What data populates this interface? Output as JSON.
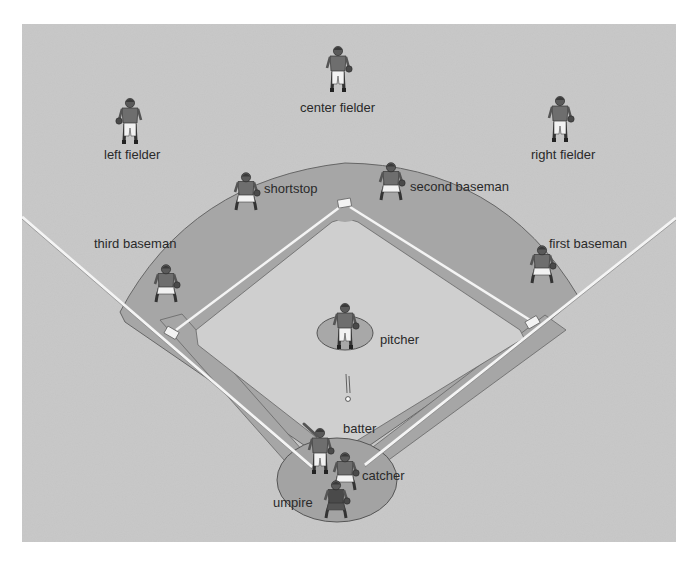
{
  "figure": {
    "colors": {
      "grass": "#c9c9c9",
      "dirt": "#a3a3a3",
      "infield_grass": "#cdcdcd",
      "line": "#f4f4f4",
      "outline": "#555555",
      "jersey": "#6e6e6e",
      "pants": "#f2f2f2",
      "text": "#2a2a2a"
    },
    "positions": [
      {
        "id": "left-fielder",
        "label": "left fielder",
        "label_x": 104,
        "label_y": 148,
        "player_x": 130,
        "player_y": 118,
        "pose": "stand-glove-left"
      },
      {
        "id": "center-fielder",
        "label": "center fielder",
        "label_x": 300,
        "label_y": 101,
        "player_x": 338,
        "player_y": 66,
        "pose": "stand-glove-right"
      },
      {
        "id": "right-fielder",
        "label": "right fielder",
        "label_x": 531,
        "label_y": 148,
        "player_x": 560,
        "player_y": 116,
        "pose": "walk"
      },
      {
        "id": "shortstop",
        "label": "shortstop",
        "label_x": 264,
        "label_y": 182,
        "player_x": 246,
        "player_y": 190,
        "pose": "crouch"
      },
      {
        "id": "second-baseman",
        "label": "second baseman",
        "label_x": 410,
        "label_y": 180,
        "player_x": 391,
        "player_y": 180,
        "pose": "crouch"
      },
      {
        "id": "third-baseman",
        "label": "third baseman",
        "label_x": 94,
        "label_y": 237,
        "player_x": 166,
        "player_y": 282,
        "pose": "crouch"
      },
      {
        "id": "first-baseman",
        "label": "first baseman",
        "label_x": 549,
        "label_y": 237,
        "player_x": 542,
        "player_y": 263,
        "pose": "crouch"
      },
      {
        "id": "pitcher",
        "label": "pitcher",
        "label_x": 380,
        "label_y": 333,
        "player_x": 345,
        "player_y": 323,
        "pose": "throw"
      },
      {
        "id": "batter",
        "label": "batter",
        "label_x": 343,
        "label_y": 422,
        "player_x": 320,
        "player_y": 448,
        "pose": "bat"
      },
      {
        "id": "catcher",
        "label": "catcher",
        "label_x": 362,
        "label_y": 469,
        "player_x": 345,
        "player_y": 470,
        "pose": "crouch"
      },
      {
        "id": "umpire",
        "label": "umpire",
        "label_x": 273,
        "label_y": 496,
        "player_x": 336,
        "player_y": 498,
        "pose": "ump"
      }
    ],
    "field": {
      "image_box": {
        "x": 22,
        "y": 24,
        "w": 654,
        "h": 518
      },
      "home": {
        "x": 337,
        "y": 455
      },
      "first": {
        "x": 533,
        "y": 322
      },
      "second": {
        "x": 345,
        "y": 203
      },
      "third": {
        "x": 172,
        "y": 333
      },
      "mound": {
        "x": 345,
        "y": 333,
        "rx": 28,
        "ry": 17
      },
      "home_circle": {
        "x": 337,
        "y": 480,
        "rx": 60,
        "ry": 42
      },
      "ball": {
        "x": 348,
        "y": 399
      }
    }
  }
}
